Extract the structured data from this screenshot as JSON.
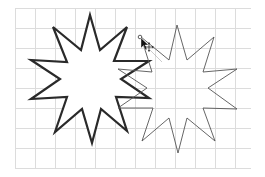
{
  "canvas": {
    "width": 265,
    "height": 177,
    "background": "#ffffff"
  },
  "grid": {
    "x0": 15,
    "y0": 8,
    "x1": 251,
    "y1": 168,
    "cell": 20,
    "color": "#dcdcdc"
  },
  "shapes": [
    {
      "name": "star-bold-selected",
      "type": "star",
      "points_count": 10,
      "stroke": "#2a2a2a",
      "stroke_width": 2.2,
      "fill": "#ffffff",
      "points": "90,15 100,50 127,27 114,61 149,61 121,79 149,98 116,97 127,131 101,109 92,143 82,109 55,132 67,97 31,99 60,79 31,60 67,62 53,27 81,50"
    },
    {
      "name": "star-thin-copy",
      "type": "star",
      "points_count": 10,
      "stroke": "#555555",
      "stroke_width": 0.9,
      "fill": "none",
      "points": "177,25 187,60 214,37 203,72 237,69 208,88 237,109 203,108 215,141 187,118 178,153 169,118 142,141 153,108 118,108 147,88 118,69 152,72 141,37 169,60"
    }
  ],
  "cursor": {
    "type": "move-arrow",
    "x": 140,
    "y": 36,
    "handle_color": "#333333"
  }
}
